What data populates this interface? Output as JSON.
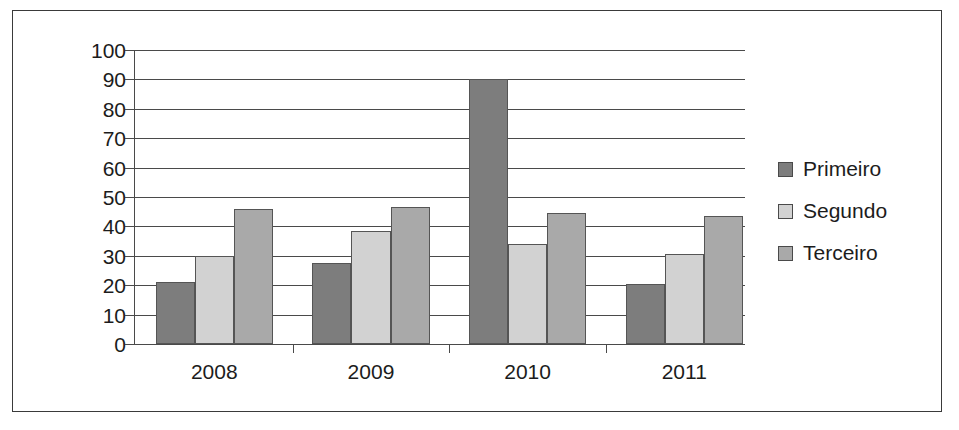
{
  "chart_data": {
    "type": "bar",
    "title": "",
    "xlabel": "",
    "ylabel": "",
    "categories": [
      "2008",
      "2009",
      "2010",
      "2011"
    ],
    "series": [
      {
        "name": "Primeiro",
        "color": "#7d7d7d",
        "values": [
          21,
          27.5,
          90,
          20.5
        ]
      },
      {
        "name": "Segundo",
        "color": "#d2d2d2",
        "values": [
          30,
          38.5,
          34,
          30.5
        ]
      },
      {
        "name": "Terceiro",
        "color": "#a9a9a9",
        "values": [
          46,
          46.5,
          44.5,
          43.5
        ]
      }
    ],
    "ylim": [
      0,
      100
    ],
    "ytick_values": [
      0,
      10,
      20,
      30,
      40,
      50,
      60,
      70,
      80,
      90,
      100
    ],
    "ytick_labels": [
      "0",
      "10",
      "20",
      "30",
      "40",
      "50",
      "60",
      "70",
      "80",
      "90",
      "100"
    ],
    "grid": true,
    "legend_position": "right"
  },
  "legend": {
    "items": [
      {
        "label": "Primeiro",
        "swatch_color": "#7d7d7d"
      },
      {
        "label": "Segundo",
        "swatch_color": "#d2d2d2"
      },
      {
        "label": "Terceiro",
        "swatch_color": "#a9a9a9"
      }
    ]
  },
  "colors": {
    "axis": "#4a4a4a",
    "text": "#1c1c1c",
    "frame": "#3a3a3a",
    "background": "#ffffff"
  }
}
